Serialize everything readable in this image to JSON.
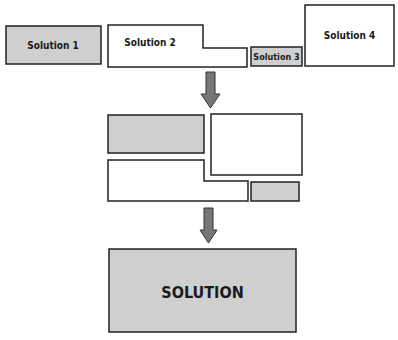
{
  "diagram": {
    "colors": {
      "gray_fill": "#cfcfcf",
      "white_fill": "#ffffff",
      "stroke": "#222222",
      "arrow": "#777777"
    },
    "top_row": {
      "solution1": {
        "label": "Solution 1"
      },
      "solution2": {
        "label": "Solution 2"
      },
      "solution3": {
        "label": "Solution 3"
      },
      "solution4": {
        "label": "Solution 4"
      }
    },
    "final": {
      "label": "SOLUTION"
    }
  }
}
